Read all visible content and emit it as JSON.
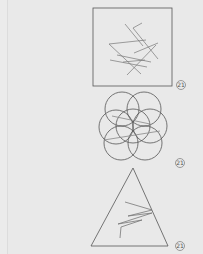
{
  "figures": [
    {
      "type": "square-with-line-segments",
      "label": "21"
    },
    {
      "type": "overlapping-circles-rosette",
      "label": "21"
    },
    {
      "type": "triangle-with-zigzag",
      "label": "21"
    }
  ],
  "colors": {
    "background": "#ebebeb",
    "stroke": "#555555"
  }
}
